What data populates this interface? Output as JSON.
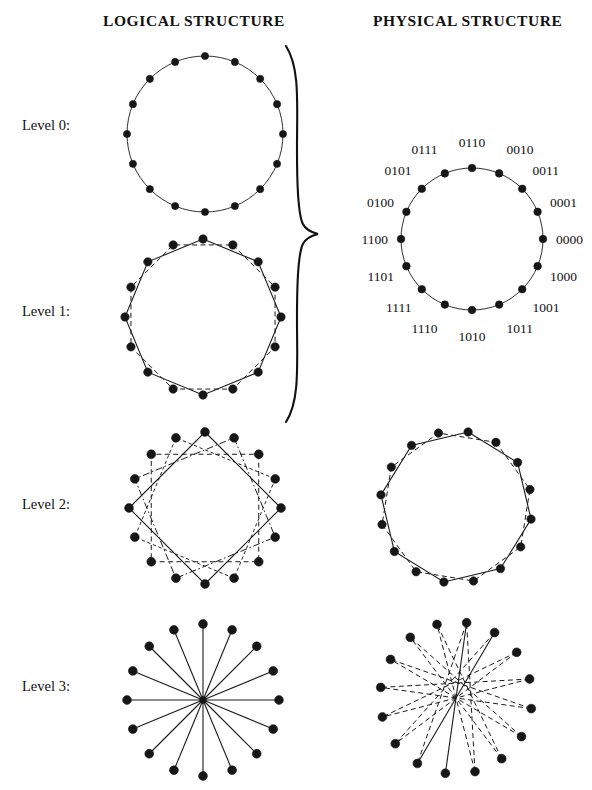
{
  "headers": {
    "logical": "LOGICAL STRUCTURE",
    "physical": "PHYSICAL STRUCTURE"
  },
  "levels": [
    {
      "id": "level0",
      "label": "Level 0:"
    },
    {
      "id": "level1",
      "label": "Level 1:"
    },
    {
      "id": "level2",
      "label": "Level 2:"
    },
    {
      "id": "level3",
      "label": "Level 3:"
    }
  ],
  "colors": {
    "ink": "#1a1a1a",
    "node": "#161616",
    "background": "#ffffff"
  },
  "chart_data": {
    "type": "diagram",
    "node_count": 16,
    "panels": [
      {
        "name": "logical-level-0",
        "column": "logical",
        "level": 0,
        "shape": "circle",
        "nodes": 16,
        "edge_sets": [
          {
            "style": "solid",
            "description": "single ring connecting all 16 nodes in order",
            "step": 1
          }
        ]
      },
      {
        "name": "logical-level-1",
        "column": "logical",
        "level": 1,
        "shape": "two-interleaved-octagons",
        "nodes": 16,
        "edge_sets": [
          {
            "style": "solid",
            "description": "octagon over even-index nodes",
            "step": 2,
            "offset": 0
          },
          {
            "style": "dashed",
            "description": "octagon over odd-index nodes",
            "step": 2,
            "offset": 1
          }
        ]
      },
      {
        "name": "logical-level-2",
        "column": "logical",
        "level": 2,
        "shape": "four-interleaved-squares",
        "nodes": 16,
        "edge_sets": [
          {
            "style": "solid",
            "description": "square on nodes 0,4,8,12",
            "step": 4,
            "offset": 0
          },
          {
            "style": "dash-dot",
            "description": "square on nodes 1,5,9,13",
            "step": 4,
            "offset": 1
          },
          {
            "style": "dashed",
            "description": "square on nodes 2,6,10,14",
            "step": 4,
            "offset": 2
          },
          {
            "style": "dashed-fine",
            "description": "square on nodes 3,7,11,15",
            "step": 4,
            "offset": 3
          }
        ]
      },
      {
        "name": "logical-level-3",
        "column": "logical",
        "level": 3,
        "shape": "star-16-spokes",
        "nodes": 16,
        "edge_sets": [
          {
            "style": "solid",
            "description": "each of the 16 nodes joined to the common centre point",
            "step": 8
          }
        ]
      },
      {
        "name": "physical-level-0-1",
        "column": "physical",
        "level": "0-1",
        "shape": "labelled-circle",
        "nodes": 16,
        "edge_sets": [
          {
            "style": "solid",
            "description": "ring through all 16 physically adjacent nodes",
            "step": 1
          }
        ],
        "note": "Levels 0 and 1 share one physical drawing, indicated by the large brace."
      },
      {
        "name": "physical-level-2",
        "column": "physical",
        "level": 2,
        "shape": "two-interleaved-octagons",
        "nodes": 16,
        "edge_sets": [
          {
            "style": "solid",
            "description": "octagon over even-index physical nodes",
            "step": 2,
            "offset": 0
          },
          {
            "style": "dashed",
            "description": "octagon over odd-index physical nodes",
            "step": 2,
            "offset": 1
          }
        ]
      },
      {
        "name": "physical-level-3",
        "column": "physical",
        "level": 3,
        "shape": "lattice-of-quadrilaterals",
        "nodes": 16,
        "edge_sets": [
          {
            "style": "solid",
            "description": "central ladder of the lattice",
            "step": 8
          },
          {
            "style": "dashed",
            "description": "remaining lattice rails connecting antipodal node pairs",
            "step": 8
          }
        ]
      }
    ],
    "address_labels": {
      "description": "Gray-code style 4-bit addresses around the physical Level 0/1 ring, read clockwise from the top.",
      "bits": 4,
      "items": [
        {
          "address": "0110",
          "angle_deg": 0,
          "placement": "top"
        },
        {
          "address": "0010",
          "angle_deg": 22.5,
          "placement": "upper-right"
        },
        {
          "address": "0011",
          "angle_deg": 45,
          "placement": "upper-right"
        },
        {
          "address": "0001",
          "angle_deg": 67.5,
          "placement": "right"
        },
        {
          "address": "0000",
          "angle_deg": 90,
          "placement": "right"
        },
        {
          "address": "1000",
          "angle_deg": 112.5,
          "placement": "right"
        },
        {
          "address": "1001",
          "angle_deg": 135,
          "placement": "lower-right"
        },
        {
          "address": "1011",
          "angle_deg": 157.5,
          "placement": "lower-right"
        },
        {
          "address": "1010",
          "angle_deg": 180,
          "placement": "bottom"
        },
        {
          "address": "1110",
          "angle_deg": 202.5,
          "placement": "lower-left"
        },
        {
          "address": "1111",
          "angle_deg": 225,
          "placement": "lower-left"
        },
        {
          "address": "1101",
          "angle_deg": 247.5,
          "placement": "left"
        },
        {
          "address": "1100",
          "angle_deg": 270,
          "placement": "left"
        },
        {
          "address": "0100",
          "angle_deg": 292.5,
          "placement": "left"
        },
        {
          "address": "0101",
          "angle_deg": 315,
          "placement": "upper-left"
        },
        {
          "address": "0111",
          "angle_deg": 337.5,
          "placement": "upper-left"
        }
      ]
    }
  }
}
